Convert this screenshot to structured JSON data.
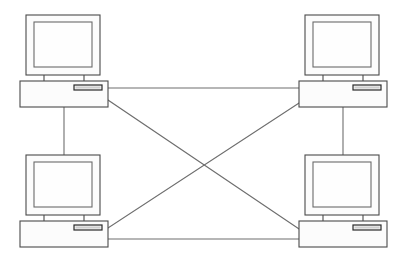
{
  "diagram": {
    "title": "Mesh Network Topology",
    "description": "Four desktop computers fully interconnected in a mesh topology",
    "canvas": {
      "width": 404,
      "height": 259,
      "background": "#ffffff"
    },
    "colors": {
      "background": "#ffffff",
      "outline": "#4a4a4a",
      "link": "#6e6e6e",
      "screen_fill": "#fefefe",
      "body_fill": "#fcfcfc",
      "slot_dark": "#2a2a2a",
      "slot_fill": "#cfcfcf"
    },
    "nodes": [
      {
        "id": "node-top-left",
        "label": "Computer 1",
        "position": "top-left",
        "icon": "desktop-computer-icon",
        "monitor": {
          "x": 26,
          "y": 15,
          "width": 74,
          "height": 60
        },
        "screen": {
          "x": 34,
          "y": 22,
          "width": 58,
          "height": 45
        },
        "neck": {
          "x1": 44,
          "x2": 84,
          "y_top": 75,
          "y_bottom": 81
        },
        "base": {
          "x": 20,
          "y": 81,
          "width": 88,
          "height": 26
        },
        "drive_slot": {
          "x": 74,
          "y": 85,
          "width": 28,
          "height": 5
        }
      },
      {
        "id": "node-top-right",
        "label": "Computer 2",
        "position": "top-right",
        "icon": "desktop-computer-icon",
        "monitor": {
          "x": 305,
          "y": 15,
          "width": 74,
          "height": 60
        },
        "screen": {
          "x": 313,
          "y": 22,
          "width": 58,
          "height": 45
        },
        "neck": {
          "x1": 323,
          "x2": 363,
          "y_top": 75,
          "y_bottom": 81
        },
        "base": {
          "x": 299,
          "y": 81,
          "width": 88,
          "height": 26
        },
        "drive_slot": {
          "x": 353,
          "y": 85,
          "width": 28,
          "height": 5
        }
      },
      {
        "id": "node-bottom-left",
        "label": "Computer 3",
        "position": "bottom-left",
        "icon": "desktop-computer-icon",
        "monitor": {
          "x": 26,
          "y": 155,
          "width": 74,
          "height": 60
        },
        "screen": {
          "x": 34,
          "y": 162,
          "width": 58,
          "height": 45
        },
        "neck": {
          "x1": 44,
          "x2": 84,
          "y_top": 215,
          "y_bottom": 221
        },
        "base": {
          "x": 20,
          "y": 221,
          "width": 88,
          "height": 26
        },
        "drive_slot": {
          "x": 74,
          "y": 225,
          "width": 28,
          "height": 5
        }
      },
      {
        "id": "node-bottom-right",
        "label": "Computer 4",
        "position": "bottom-right",
        "icon": "desktop-computer-icon",
        "monitor": {
          "x": 305,
          "y": 155,
          "width": 74,
          "height": 60
        },
        "screen": {
          "x": 313,
          "y": 162,
          "width": 58,
          "height": 45
        },
        "neck": {
          "x1": 323,
          "x2": 363,
          "y_top": 215,
          "y_bottom": 221
        },
        "base": {
          "x": 299,
          "y": 221,
          "width": 88,
          "height": 26
        },
        "drive_slot": {
          "x": 353,
          "y": 225,
          "width": 28,
          "height": 5
        }
      }
    ],
    "links": [
      {
        "id": "link-top-horizontal",
        "from": "node-top-left",
        "to": "node-top-right",
        "kind": "horizontal",
        "x1": 108,
        "y1": 88,
        "x2": 299,
        "y2": 88
      },
      {
        "id": "link-bottom-horizontal",
        "from": "node-bottom-left",
        "to": "node-bottom-right",
        "kind": "horizontal",
        "x1": 108,
        "y1": 239,
        "x2": 299,
        "y2": 239
      },
      {
        "id": "link-left-vertical",
        "from": "node-top-left",
        "to": "node-bottom-left",
        "kind": "vertical",
        "x1": 64,
        "y1": 107,
        "x2": 64,
        "y2": 155
      },
      {
        "id": "link-right-vertical",
        "from": "node-top-right",
        "to": "node-bottom-right",
        "kind": "vertical",
        "x1": 343,
        "y1": 107,
        "x2": 343,
        "y2": 155
      },
      {
        "id": "link-diagonal-descending",
        "from": "node-top-left",
        "to": "node-bottom-right",
        "kind": "diagonal",
        "x1": 108,
        "y1": 100,
        "x2": 299,
        "y2": 229
      },
      {
        "id": "link-diagonal-ascending",
        "from": "node-bottom-left",
        "to": "node-top-right",
        "kind": "diagonal",
        "x1": 108,
        "y1": 228,
        "x2": 299,
        "y2": 103
      }
    ]
  }
}
